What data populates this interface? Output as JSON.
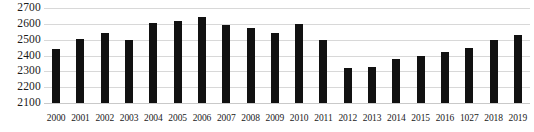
{
  "chart_data": {
    "type": "bar",
    "title": "",
    "subtitle": "",
    "xlabel": "",
    "ylabel": "",
    "categories": [
      "2000",
      "2001",
      "2002",
      "2003",
      "2004",
      "2005",
      "2006",
      "2007",
      "2008",
      "2009",
      "2010",
      "2011",
      "2012",
      "2013",
      "2014",
      "2015",
      "2016",
      "1027",
      "2018",
      "2019"
    ],
    "values": [
      2440,
      2505,
      2545,
      2495,
      2605,
      2615,
      2645,
      2590,
      2575,
      2540,
      2600,
      2495,
      2320,
      2325,
      2375,
      2400,
      2425,
      2450,
      2500,
      2530
    ],
    "series": [
      {
        "name": "",
        "values": [
          2440,
          2505,
          2545,
          2495,
          2605,
          2615,
          2645,
          2590,
          2575,
          2540,
          2600,
          2495,
          2320,
          2325,
          2375,
          2400,
          2425,
          2450,
          2500,
          2530
        ]
      }
    ],
    "ylim": [
      2100,
      2700
    ],
    "ytick_labels": [
      "2700",
      "2600",
      "2500",
      "2400",
      "2300",
      "2200",
      "2100"
    ],
    "ytick_values": [
      2700,
      2600,
      2500,
      2400,
      2300,
      2200,
      2100
    ],
    "ytick_step": 100,
    "grid": true,
    "grid_axis": "y",
    "legend": false,
    "legend_position": "none",
    "annotations": [],
    "colors": {
      "bar": "#111111",
      "grid": "#d8d8d8",
      "text": "#1a1a1a",
      "background": "#ffffff"
    }
  }
}
